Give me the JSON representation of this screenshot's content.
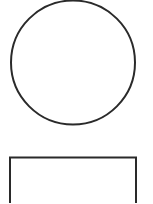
{
  "canvas": {
    "width": 153,
    "height": 203,
    "background": "#ffffff"
  },
  "shapes": [
    {
      "type": "circle",
      "name": "circle-shape",
      "cx": 73,
      "cy": 62.5,
      "r": 62,
      "stroke": "#2a2a2a",
      "stroke_width": 2,
      "fill": "#ffffff"
    },
    {
      "type": "rect",
      "name": "rectangle-shape",
      "x": 10,
      "y": 157.5,
      "width": 126,
      "height": 60,
      "stroke": "#2a2a2a",
      "stroke_width": 2,
      "fill": "#ffffff"
    }
  ]
}
